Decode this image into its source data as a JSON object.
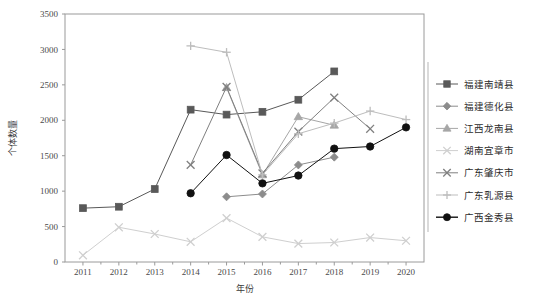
{
  "chart_data": {
    "type": "line",
    "title": "",
    "xlabel": "年份",
    "ylabel": "个体数量",
    "categories": [
      "2011",
      "2012",
      "2013",
      "2014",
      "2015",
      "2016",
      "2017",
      "2018",
      "2019",
      "2020"
    ],
    "x": [
      2011,
      2012,
      2013,
      2014,
      2015,
      2016,
      2017,
      2018,
      2019,
      2020
    ],
    "xlim": [
      2010.5,
      2020.5
    ],
    "ylim": [
      0,
      3500
    ],
    "yticks": [
      0,
      500,
      1000,
      1500,
      2000,
      2500,
      3000,
      3500
    ],
    "ytick_labels": [
      "0",
      "500",
      "1000",
      "1500",
      "2000",
      "2500",
      "3000",
      "3500"
    ],
    "grid": false,
    "legend_position": "right",
    "series": [
      {
        "name": "福建南靖县",
        "marker": "square",
        "color": "#595959",
        "x": [
          2011,
          2012,
          2013,
          2014,
          2015,
          2016,
          2017,
          2018
        ],
        "values": [
          760,
          780,
          1030,
          2150,
          2080,
          2120,
          2290,
          2690
        ]
      },
      {
        "name": "福建德化县",
        "marker": "diamond",
        "color": "#8c8c8c",
        "x": [
          2015,
          2016,
          2017,
          2018
        ],
        "values": [
          920,
          960,
          1370,
          1480
        ]
      },
      {
        "name": "江西龙南县",
        "marker": "triangle",
        "color": "#a6a6a6",
        "x": [
          2015,
          2016,
          2017,
          2018
        ],
        "values": [
          2460,
          1230,
          2050,
          1930
        ]
      },
      {
        "name": "湖南宜章市",
        "marker": "x-light",
        "color": "#cfcfcf",
        "x": [
          2011,
          2012,
          2013,
          2014,
          2015,
          2016,
          2017,
          2018,
          2019,
          2020
        ],
        "values": [
          95,
          490,
          395,
          285,
          620,
          355,
          260,
          275,
          345,
          300
        ]
      },
      {
        "name": "广东肇庆市",
        "marker": "x-dark",
        "color": "#7f7f7f",
        "x": [
          2014,
          2015,
          2016,
          2017,
          2018,
          2019
        ],
        "values": [
          1370,
          2470,
          1250,
          1840,
          2320,
          1880
        ]
      },
      {
        "name": "广东乳源县",
        "marker": "plus",
        "color": "#bdbdbd",
        "x": [
          2014,
          2015,
          2016,
          2017,
          2018,
          2019,
          2020
        ],
        "values": [
          3050,
          2960,
          1230,
          1810,
          1960,
          2130,
          2010
        ]
      },
      {
        "name": "广西金秀县",
        "marker": "circle",
        "color": "#111111",
        "x": [
          2014,
          2015,
          2016,
          2017,
          2018,
          2019,
          2020
        ],
        "values": [
          970,
          1510,
          1110,
          1220,
          1600,
          1630,
          1900
        ]
      }
    ]
  },
  "legend": {
    "items": [
      {
        "label": "福建南靖县"
      },
      {
        "label": "福建德化县"
      },
      {
        "label": "江西龙南县"
      },
      {
        "label": "湖南宜章市"
      },
      {
        "label": "广东肇庆市"
      },
      {
        "label": "广东乳源县"
      },
      {
        "label": "广西金秀县"
      }
    ]
  },
  "axes": {
    "y_title": "个体数量",
    "x_title": "年份"
  }
}
